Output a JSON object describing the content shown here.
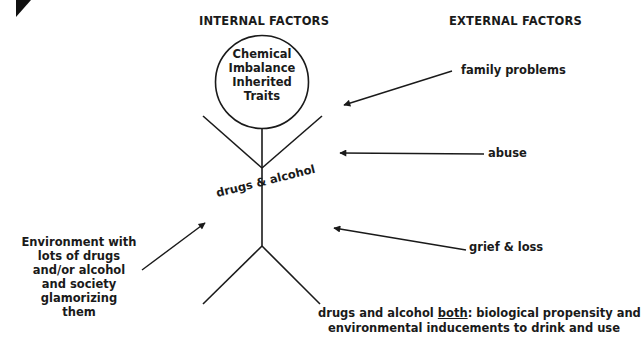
{
  "headers": {
    "internal": "INTERNAL FACTORS",
    "external": "EXTERNAL FACTORS"
  },
  "head_circle": {
    "lines": [
      "Chemical",
      "Imbalance",
      "Inherited",
      "Traits"
    ]
  },
  "torso_label": "drugs & alcohol",
  "external_factors": [
    {
      "label": "family problems"
    },
    {
      "label": "abuse"
    },
    {
      "label": "grief & loss"
    }
  ],
  "environment": {
    "lines": [
      "Environment with",
      "lots of drugs",
      "and/or alcohol",
      "and society",
      "glamorizing",
      "them"
    ]
  },
  "conclusion": {
    "prefix": "drugs and alcohol ",
    "emphasis": "both",
    "suffix": ": biological propensity and",
    "line2": "environmental inducements to drink and use"
  },
  "colors": {
    "ink": "#1a1a1a",
    "background": "#ffffff"
  }
}
